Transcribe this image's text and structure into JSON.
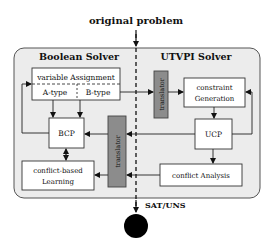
{
  "title": "original problem",
  "output_label": "SAT/UNS",
  "sections": {
    "left": "Boolean Solver",
    "right": "UTVPI Solver"
  },
  "nodes": {
    "variable_assignment": "variable Assignment",
    "a_type": "A-type",
    "b_type": "B-type",
    "bcp": "BCP",
    "learning_line1": "conflict-based",
    "learning_line2": "Learning",
    "translator_top": "translator",
    "translator_bottom": "translator",
    "constraint_line1": "constraint",
    "constraint_line2": "Generation",
    "ucp": "UCP",
    "conflict_analysis": "conflict Analysis"
  },
  "colors": {
    "panel_fill": "#ececec",
    "panel_stroke": "#555555",
    "box_fill": "#ffffff",
    "translator_fill": "#8c8c8c",
    "ink": "#111111"
  }
}
